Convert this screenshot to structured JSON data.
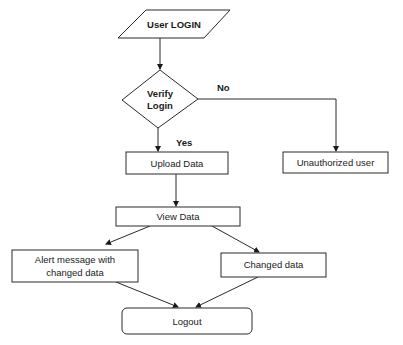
{
  "diagram": {
    "type": "flowchart",
    "nodes": [
      {
        "id": "user_login",
        "shape": "parallelogram",
        "label": "User LOGIN"
      },
      {
        "id": "verify_login",
        "shape": "diamond",
        "label_line1": "Verify",
        "label_line2": "Login"
      },
      {
        "id": "upload_data",
        "shape": "rectangle",
        "label": "Upload Data"
      },
      {
        "id": "unauthorized_user",
        "shape": "rectangle",
        "label": "Unauthorized user"
      },
      {
        "id": "view_data",
        "shape": "rectangle",
        "label": "View Data"
      },
      {
        "id": "alert_message",
        "shape": "rectangle",
        "label_line1": "Alert message with",
        "label_line2": "changed data"
      },
      {
        "id": "changed_data",
        "shape": "rectangle",
        "label": "Changed data"
      },
      {
        "id": "logout",
        "shape": "rounded-rectangle",
        "label": "Logout"
      }
    ],
    "edges": [
      {
        "from": "user_login",
        "to": "verify_login",
        "label": ""
      },
      {
        "from": "verify_login",
        "to": "upload_data",
        "label": "Yes"
      },
      {
        "from": "verify_login",
        "to": "unauthorized_user",
        "label": "No"
      },
      {
        "from": "upload_data",
        "to": "view_data",
        "label": ""
      },
      {
        "from": "view_data",
        "to": "alert_message",
        "label": ""
      },
      {
        "from": "view_data",
        "to": "changed_data",
        "label": ""
      },
      {
        "from": "alert_message",
        "to": "logout",
        "label": ""
      },
      {
        "from": "changed_data",
        "to": "logout",
        "label": ""
      }
    ]
  },
  "labels": {
    "user_login": "User LOGIN",
    "verify_line1": "Verify",
    "verify_line2": "Login",
    "upload_data": "Upload Data",
    "unauthorized_user": "Unauthorized user",
    "view_data": "View Data",
    "alert_line1": "Alert message with",
    "alert_line2": "changed data",
    "changed_data": "Changed data",
    "logout": "Logout",
    "edge_yes": "Yes",
    "edge_no": "No"
  }
}
